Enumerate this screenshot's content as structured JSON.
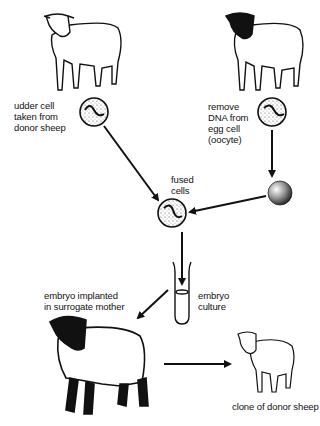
{
  "diagram": {
    "type": "process-flow",
    "labels": {
      "udder_cell": "udder cell\ntaken from\ndonor sheep",
      "remove_dna": "remove\nDNA from\negg cell\n(oocyte)",
      "fused_cells": "fused\ncells",
      "embryo_culture": "embryo\nculture",
      "embryo_implanted": "embryo implanted\nin surrogate mother",
      "clone": "clone of donor sheep"
    },
    "nodes": [
      {
        "id": "donor-sheep",
        "desc": "white-faced sheep (donor)"
      },
      {
        "id": "egg-sheep",
        "desc": "black-faced sheep (egg donor)"
      },
      {
        "id": "udder-cell",
        "desc": "cell with nucleus"
      },
      {
        "id": "egg-cell",
        "desc": "oocyte with DNA"
      },
      {
        "id": "enucleated-egg",
        "desc": "stippled egg without DNA"
      },
      {
        "id": "fused-cell",
        "desc": "fused cell"
      },
      {
        "id": "test-tube",
        "desc": "embryo culture tube"
      },
      {
        "id": "surrogate-sheep",
        "desc": "black-faced surrogate mother"
      },
      {
        "id": "clone-sheep",
        "desc": "white-faced clone"
      }
    ],
    "edges": [
      [
        "udder-cell",
        "fused-cell"
      ],
      [
        "egg-cell",
        "enucleated-egg"
      ],
      [
        "enucleated-egg",
        "fused-cell"
      ],
      [
        "fused-cell",
        "test-tube"
      ],
      [
        "test-tube",
        "surrogate-sheep"
      ],
      [
        "surrogate-sheep",
        "clone-sheep"
      ]
    ]
  }
}
